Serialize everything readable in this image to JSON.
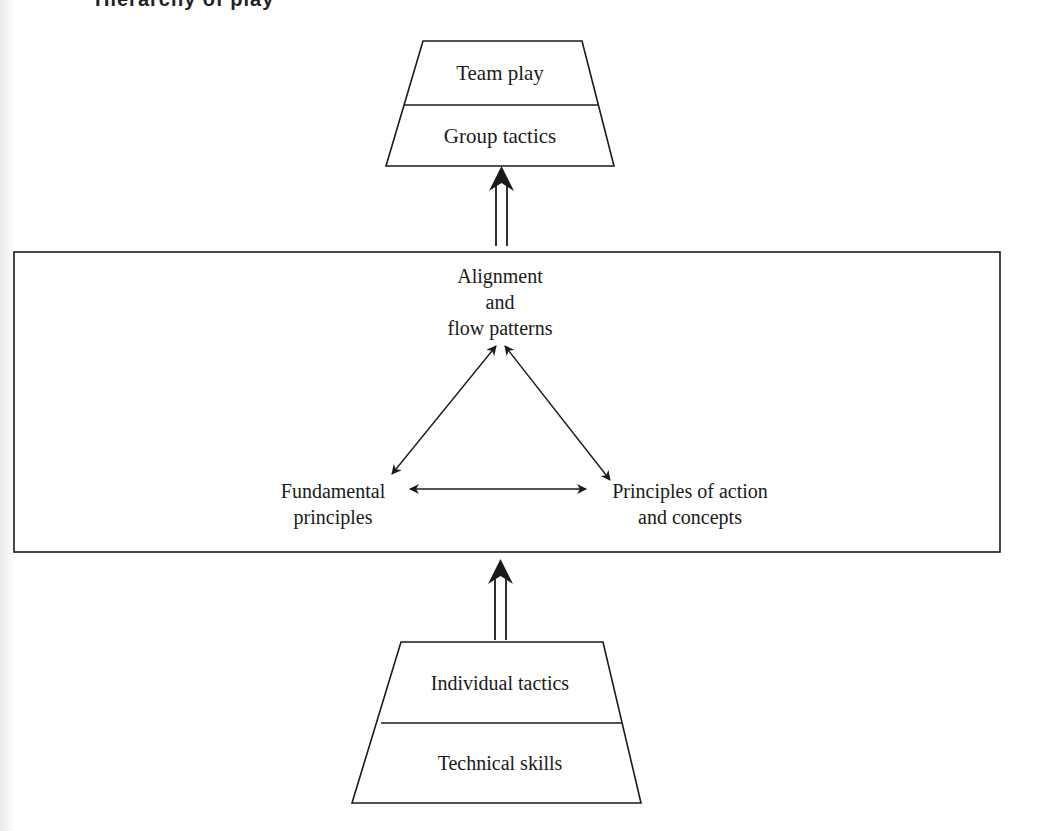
{
  "page": {
    "clipped_heading": "Hierarchy of play"
  },
  "diagram": {
    "top_trapezoid": {
      "upper_label": "Team play",
      "lower_label": "Group tactics"
    },
    "central_box": {
      "nodes": {
        "top": {
          "line1": "Alignment",
          "line2": "and",
          "line3": "flow patterns"
        },
        "left": {
          "line1": "Fundamental",
          "line2": "principles"
        },
        "right": {
          "line1": "Principles of action",
          "line2": "and concepts"
        }
      },
      "edges": [
        {
          "from": "left",
          "to": "top",
          "type": "bidirectional"
        },
        {
          "from": "right",
          "to": "top",
          "type": "bidirectional"
        },
        {
          "from": "left",
          "to": "right",
          "type": "bidirectional"
        }
      ]
    },
    "bottom_trapezoid": {
      "upper_label": "Individual tactics",
      "lower_label": "Technical skills"
    },
    "flow_arrows": [
      {
        "from": "central_box",
        "to": "top_trapezoid",
        "style": "double-line-up"
      },
      {
        "from": "bottom_trapezoid",
        "to": "central_box",
        "style": "double-line-up"
      }
    ],
    "colors": {
      "stroke": "#1a1a1a",
      "background": "#ffffff"
    }
  }
}
